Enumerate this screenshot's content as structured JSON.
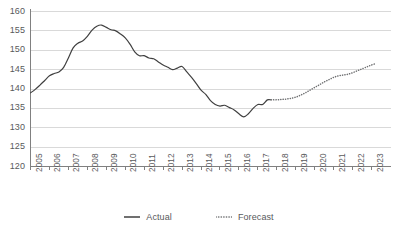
{
  "chart_data": {
    "type": "line",
    "title": "",
    "subtitle": "",
    "xlabel": "",
    "ylabel": "",
    "xlim": [
      2005,
      2023
    ],
    "ylim": [
      120,
      160
    ],
    "ytick_step": 5,
    "grid": true,
    "legend_position": "bottom",
    "x_tick_labels": [
      "2005",
      "2006",
      "2007",
      "2008",
      "2009",
      "2010",
      "2011",
      "2012",
      "2013",
      "2014",
      "2015",
      "2016",
      "2017",
      "2018",
      "2019",
      "2020",
      "2021",
      "2022",
      "2023"
    ],
    "y_tick_labels": [
      "120",
      "125",
      "130",
      "135",
      "140",
      "145",
      "150",
      "155",
      "160"
    ],
    "series": [
      {
        "name": "Actual",
        "style": "solid",
        "color": "#404040",
        "x": [
          2005.0,
          2005.25,
          2005.5,
          2005.75,
          2006.0,
          2006.25,
          2006.5,
          2006.75,
          2007.0,
          2007.25,
          2007.5,
          2007.75,
          2008.0,
          2008.25,
          2008.5,
          2008.75,
          2009.0,
          2009.25,
          2009.5,
          2009.75,
          2010.0,
          2010.25,
          2010.5,
          2010.75,
          2011.0,
          2011.25,
          2011.5,
          2011.75,
          2012.0,
          2012.25,
          2012.5,
          2012.75,
          2013.0,
          2013.25,
          2013.5,
          2013.75,
          2014.0,
          2014.25,
          2014.5,
          2014.75,
          2015.0,
          2015.25,
          2015.5,
          2015.75,
          2016.0,
          2016.25,
          2016.5,
          2016.75,
          2017.0,
          2017.25,
          2017.5,
          2017.7
        ],
        "values": [
          139.0,
          139.9,
          141.0,
          142.2,
          143.4,
          144.0,
          144.4,
          145.6,
          148.0,
          150.6,
          151.8,
          152.4,
          153.6,
          155.2,
          156.2,
          156.5,
          155.9,
          155.3,
          155.0,
          154.2,
          153.2,
          151.6,
          149.6,
          148.6,
          148.6,
          148.0,
          147.8,
          147.0,
          146.2,
          145.6,
          145.0,
          145.4,
          145.8,
          144.4,
          143.0,
          141.4,
          139.7,
          138.6,
          137.0,
          136.0,
          135.6,
          135.8,
          135.2,
          134.6,
          133.6,
          132.8,
          133.6,
          135.0,
          136.0,
          136.0,
          137.2,
          137.2
        ]
      },
      {
        "name": "Forecast",
        "style": "dotted",
        "color": "#6f7072",
        "x": [
          2017.7,
          2018.0,
          2018.25,
          2018.5,
          2018.75,
          2019.0,
          2019.25,
          2019.5,
          2019.75,
          2020.0,
          2020.25,
          2020.5,
          2020.75,
          2021.0,
          2021.25,
          2021.5,
          2021.75,
          2022.0,
          2022.25,
          2022.5,
          2022.75,
          2023.0,
          2023.25
        ],
        "values": [
          137.2,
          137.2,
          137.3,
          137.4,
          137.6,
          137.9,
          138.4,
          139.0,
          139.7,
          140.4,
          141.1,
          141.8,
          142.4,
          143.0,
          143.4,
          143.6,
          143.8,
          144.2,
          144.7,
          145.2,
          145.7,
          146.2,
          146.6
        ]
      }
    ]
  },
  "legend": {
    "items": [
      {
        "label": "Actual",
        "style": "solid",
        "color": "#404040"
      },
      {
        "label": "Forecast",
        "style": "dotted",
        "color": "#6f7072"
      }
    ]
  },
  "axes": {
    "grid_color": "#d9d9d9",
    "axis_color": "#808080",
    "tick_text_color": "#58595b"
  }
}
